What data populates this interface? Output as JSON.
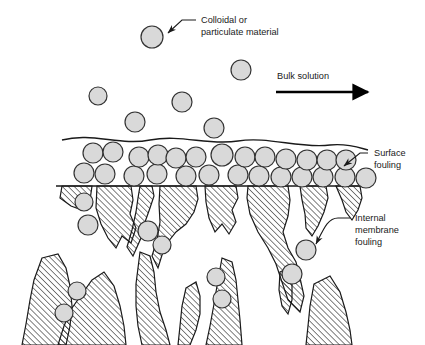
{
  "figure": {
    "background_color": "#ffffff",
    "line_color": "#1a1a1a",
    "particle_fill": "#d9d9d9",
    "particle_stroke": "#333333",
    "hatch_color": "#1a1a1a"
  },
  "labels": {
    "colloidal": {
      "line1": "Colloidal or",
      "line2": "particulate material"
    },
    "bulk_solution": {
      "line1": "Bulk solution"
    },
    "surface_fouling": {
      "line1": "Surface",
      "line2": "fouling"
    },
    "internal_fouling": {
      "line1": "Internal",
      "line2": "membrane",
      "line3": "fouling"
    }
  },
  "diagram_data": {
    "type": "schematic",
    "description": "Cross-section of a membrane showing colloidal particles in bulk solution, a cake layer of particles on the membrane surface (surface fouling), and particles trapped inside the porous membrane structure (internal membrane fouling).",
    "flow_direction": "left-to-right",
    "free_particles": [
      {
        "cx": 152,
        "cy": 37,
        "r": 11
      },
      {
        "cx": 241,
        "cy": 70,
        "r": 10
      },
      {
        "cx": 98,
        "cy": 96,
        "r": 9
      },
      {
        "cx": 182,
        "cy": 102,
        "r": 10
      },
      {
        "cx": 135,
        "cy": 122,
        "r": 10
      },
      {
        "cx": 214,
        "cy": 128,
        "r": 10
      }
    ],
    "cake_layer_row_upper": [
      {
        "cx": 93,
        "cy": 153,
        "r": 10
      },
      {
        "cx": 113,
        "cy": 152,
        "r": 10
      },
      {
        "cx": 139,
        "cy": 157,
        "r": 10
      },
      {
        "cx": 158,
        "cy": 155,
        "r": 10
      },
      {
        "cx": 176,
        "cy": 158,
        "r": 10
      },
      {
        "cx": 196,
        "cy": 157,
        "r": 10
      },
      {
        "cx": 222,
        "cy": 155,
        "r": 11
      },
      {
        "cx": 245,
        "cy": 157,
        "r": 10
      },
      {
        "cx": 265,
        "cy": 157,
        "r": 10
      },
      {
        "cx": 286,
        "cy": 159,
        "r": 10
      },
      {
        "cx": 307,
        "cy": 160,
        "r": 10
      },
      {
        "cx": 327,
        "cy": 160,
        "r": 10
      },
      {
        "cx": 346,
        "cy": 160,
        "r": 10
      }
    ],
    "cake_layer_row_lower": [
      {
        "cx": 84,
        "cy": 173,
        "r": 10
      },
      {
        "cx": 105,
        "cy": 174,
        "r": 10
      },
      {
        "cx": 134,
        "cy": 176,
        "r": 10
      },
      {
        "cx": 157,
        "cy": 174,
        "r": 10
      },
      {
        "cx": 186,
        "cy": 176,
        "r": 10
      },
      {
        "cx": 209,
        "cy": 175,
        "r": 10
      },
      {
        "cx": 238,
        "cy": 175,
        "r": 10
      },
      {
        "cx": 259,
        "cy": 176,
        "r": 10
      },
      {
        "cx": 281,
        "cy": 177,
        "r": 10
      },
      {
        "cx": 302,
        "cy": 177,
        "r": 10
      },
      {
        "cx": 323,
        "cy": 177,
        "r": 10
      },
      {
        "cx": 345,
        "cy": 177,
        "r": 10
      },
      {
        "cx": 366,
        "cy": 178,
        "r": 10
      }
    ],
    "internal_particles": [
      {
        "cx": 84,
        "cy": 202,
        "r": 9
      },
      {
        "cx": 88,
        "cy": 225,
        "r": 10
      },
      {
        "cx": 148,
        "cy": 231,
        "r": 10
      },
      {
        "cx": 162,
        "cy": 245,
        "r": 9
      },
      {
        "cx": 306,
        "cy": 250,
        "r": 10
      },
      {
        "cx": 292,
        "cy": 274,
        "r": 10
      },
      {
        "cx": 77,
        "cy": 291,
        "r": 9
      },
      {
        "cx": 64,
        "cy": 313,
        "r": 9
      },
      {
        "cx": 216,
        "cy": 277,
        "r": 9
      },
      {
        "cx": 222,
        "cy": 299,
        "r": 9
      }
    ]
  }
}
